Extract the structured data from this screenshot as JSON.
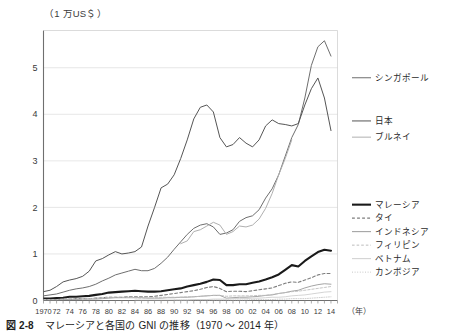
{
  "figure": {
    "caption_number": "図 2-8",
    "caption_text": "マレーシアと各国の GNI の推移（1970 〜 2014 年）",
    "y_axis_unit": "（1 万US＄）",
    "x_axis_unit": "（年）"
  },
  "chart_data": {
    "type": "line",
    "title": "マレーシアと各国の GNI の推移（1970 〜 2014 年）",
    "xlabel": "（年）",
    "ylabel": "（1 万US＄）",
    "xlim": [
      1970,
      2015
    ],
    "ylim": [
      0,
      5.8
    ],
    "grid": true,
    "legend_position": "right",
    "y_ticks": [
      0,
      1,
      2,
      3,
      4,
      5
    ],
    "y_tick_labels": [
      "0",
      "1",
      "2",
      "3",
      "4",
      "5"
    ],
    "x_ticks": [
      1970,
      1972,
      1974,
      1976,
      1978,
      1980,
      1982,
      1984,
      1986,
      1988,
      1990,
      1992,
      1994,
      1996,
      1998,
      2000,
      2002,
      2004,
      2006,
      2008,
      2010,
      2012,
      2014
    ],
    "x_tick_labels": [
      "1970",
      "72",
      "74",
      "76",
      "78",
      "80",
      "82",
      "84",
      "86",
      "88",
      "90",
      "92",
      "94",
      "96",
      "98",
      "00",
      "02",
      "04",
      "06",
      "08",
      "10",
      "12",
      "14"
    ],
    "x_minor_step": 1,
    "x": [
      1970,
      1971,
      1972,
      1973,
      1974,
      1975,
      1976,
      1977,
      1978,
      1979,
      1980,
      1981,
      1982,
      1983,
      1984,
      1985,
      1986,
      1987,
      1988,
      1989,
      1990,
      1991,
      1992,
      1993,
      1994,
      1995,
      1996,
      1997,
      1998,
      1999,
      2000,
      2001,
      2002,
      2003,
      2004,
      2005,
      2006,
      2007,
      2008,
      2009,
      2010,
      2011,
      2012,
      2013,
      2014
    ],
    "series": [
      {
        "name": "シンガポール",
        "name_en": "Singapore",
        "color": "#6e6e6e",
        "style": "solid",
        "width": 1.0,
        "legend_y": 0.825,
        "values": [
          0.1,
          0.12,
          0.14,
          0.18,
          0.22,
          0.25,
          0.27,
          0.3,
          0.35,
          0.42,
          0.48,
          0.55,
          0.59,
          0.63,
          0.67,
          0.64,
          0.64,
          0.69,
          0.8,
          0.93,
          1.1,
          1.26,
          1.42,
          1.55,
          1.62,
          1.65,
          1.58,
          1.42,
          1.45,
          1.52,
          1.7,
          1.78,
          1.82,
          1.95,
          2.2,
          2.4,
          2.7,
          3.1,
          3.5,
          3.78,
          4.35,
          5.05,
          5.45,
          5.58,
          5.25
        ]
      },
      {
        "name": "日本",
        "name_en": "Japan",
        "color": "#555555",
        "style": "solid",
        "width": 1.0,
        "legend_y": 0.665,
        "values": [
          0.19,
          0.22,
          0.3,
          0.4,
          0.44,
          0.47,
          0.52,
          0.63,
          0.85,
          0.9,
          0.98,
          1.05,
          1.0,
          1.02,
          1.05,
          1.15,
          1.6,
          2.0,
          2.42,
          2.5,
          2.7,
          3.05,
          3.45,
          3.9,
          4.15,
          4.2,
          4.05,
          3.5,
          3.3,
          3.35,
          3.5,
          3.38,
          3.3,
          3.45,
          3.75,
          3.88,
          3.8,
          3.78,
          3.75,
          3.8,
          4.2,
          4.55,
          4.78,
          4.35,
          3.65
        ]
      },
      {
        "name": "ブルネイ",
        "name_en": "Brunei",
        "color": "#b0b0b0",
        "style": "solid",
        "width": 1.0,
        "legend_y": 0.605,
        "values": [
          null,
          null,
          null,
          null,
          null,
          null,
          null,
          null,
          null,
          null,
          null,
          null,
          null,
          null,
          null,
          null,
          null,
          null,
          null,
          null,
          null,
          1.22,
          1.28,
          1.48,
          1.52,
          1.6,
          1.68,
          1.62,
          1.42,
          1.48,
          1.6,
          1.58,
          1.62,
          1.75,
          1.98,
          2.3,
          2.7,
          3.05,
          3.45,
          null,
          null,
          null,
          null,
          null,
          null
        ]
      },
      {
        "name": "マレーシア",
        "name_en": "Malaysia",
        "color": "#1a1a1a",
        "style": "solid",
        "width": 2.1,
        "legend_y": 0.355,
        "values": [
          0.04,
          0.04,
          0.05,
          0.06,
          0.08,
          0.08,
          0.09,
          0.1,
          0.12,
          0.14,
          0.17,
          0.18,
          0.19,
          0.2,
          0.21,
          0.2,
          0.19,
          0.19,
          0.2,
          0.22,
          0.24,
          0.26,
          0.3,
          0.33,
          0.36,
          0.4,
          0.45,
          0.44,
          0.33,
          0.33,
          0.35,
          0.35,
          0.38,
          0.41,
          0.45,
          0.5,
          0.56,
          0.66,
          0.76,
          0.73,
          0.85,
          0.95,
          1.04,
          1.09,
          1.07
        ]
      },
      {
        "name": "タイ",
        "name_en": "Thailand",
        "color": "#7d7d7d",
        "style": "dashed",
        "width": 1.1,
        "legend_y": 0.305,
        "values": [
          0.02,
          0.02,
          0.02,
          0.03,
          0.03,
          0.04,
          0.04,
          0.04,
          0.05,
          0.06,
          0.07,
          0.07,
          0.07,
          0.08,
          0.08,
          0.08,
          0.08,
          0.09,
          0.11,
          0.13,
          0.15,
          0.17,
          0.19,
          0.21,
          0.24,
          0.28,
          0.3,
          0.26,
          0.19,
          0.2,
          0.2,
          0.19,
          0.21,
          0.23,
          0.25,
          0.27,
          0.32,
          0.37,
          0.4,
          0.39,
          0.44,
          0.49,
          0.55,
          0.58,
          0.58
        ]
      },
      {
        "name": "インドネシア",
        "name_en": "Indonesia",
        "color": "#9a9a9a",
        "style": "solid",
        "width": 0.9,
        "legend_y": 0.255,
        "values": [
          0.01,
          0.01,
          0.01,
          0.02,
          0.02,
          0.02,
          0.03,
          0.03,
          0.03,
          0.04,
          0.05,
          0.06,
          0.06,
          0.06,
          0.06,
          0.06,
          0.05,
          0.05,
          0.05,
          0.06,
          0.06,
          0.07,
          0.07,
          0.08,
          0.09,
          0.1,
          0.11,
          0.11,
          0.05,
          0.06,
          0.07,
          0.07,
          0.08,
          0.09,
          0.11,
          0.12,
          0.15,
          0.17,
          0.2,
          0.22,
          0.27,
          0.31,
          0.34,
          0.36,
          0.35
        ]
      },
      {
        "name": "フィリピン",
        "name_en": "Philippines",
        "color": "#bdbdbd",
        "style": "dashed",
        "width": 0.9,
        "legend_y": 0.205,
        "values": [
          0.02,
          0.02,
          0.02,
          0.03,
          0.03,
          0.04,
          0.04,
          0.04,
          0.05,
          0.06,
          0.07,
          0.07,
          0.07,
          0.07,
          0.06,
          0.05,
          0.05,
          0.06,
          0.07,
          0.07,
          0.07,
          0.07,
          0.08,
          0.08,
          0.09,
          0.1,
          0.11,
          0.11,
          0.09,
          0.1,
          0.1,
          0.1,
          0.1,
          0.11,
          0.11,
          0.13,
          0.15,
          0.17,
          0.19,
          0.2,
          0.22,
          0.24,
          0.26,
          0.28,
          0.3
        ]
      },
      {
        "name": "ベトナム",
        "name_en": "Vietnam",
        "color": "#cfcfcf",
        "style": "solid",
        "width": 0.9,
        "legend_y": 0.155,
        "values": [
          null,
          null,
          null,
          null,
          null,
          null,
          null,
          null,
          null,
          null,
          null,
          null,
          null,
          null,
          0.01,
          0.01,
          0.01,
          0.01,
          0.01,
          0.01,
          0.01,
          0.01,
          0.01,
          0.02,
          0.02,
          0.02,
          0.03,
          0.03,
          0.03,
          0.04,
          0.04,
          0.04,
          0.05,
          0.05,
          0.06,
          0.07,
          0.07,
          0.08,
          0.1,
          0.11,
          0.12,
          0.14,
          0.16,
          0.18,
          0.19
        ]
      },
      {
        "name": "カンボジア",
        "name_en": "Cambodia",
        "color": "#c8c8c8",
        "style": "dotted",
        "width": 0.9,
        "legend_y": 0.105,
        "values": [
          null,
          null,
          null,
          null,
          null,
          null,
          null,
          null,
          null,
          null,
          null,
          null,
          null,
          null,
          null,
          null,
          null,
          null,
          null,
          null,
          0.01,
          0.01,
          0.01,
          0.01,
          0.01,
          0.01,
          0.01,
          0.01,
          0.01,
          0.01,
          0.01,
          0.01,
          0.02,
          0.02,
          0.02,
          0.02,
          0.03,
          0.03,
          0.04,
          0.04,
          0.04,
          0.05,
          0.06,
          0.07,
          0.08
        ]
      }
    ]
  },
  "style": {
    "grid_color": "#dcdcdc",
    "axis_color": "#8a8a8a",
    "text_color": "#3a3a3a"
  }
}
